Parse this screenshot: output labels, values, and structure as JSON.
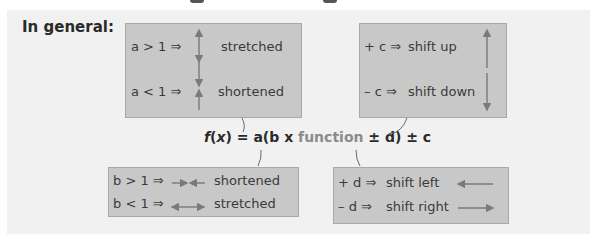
{
  "heading": "In general:",
  "formula": {
    "lhs_f": "f",
    "lhs_paren_open": "(",
    "lhs_x": "x",
    "lhs_paren_close": ")",
    "middle": " = a(b x ",
    "function_word": "function",
    "end": " ± d) ± c"
  },
  "boxes": {
    "a_box": {
      "rows": [
        {
          "condition": "a > 1 ⇒",
          "result": "stretched",
          "icon": "vertical-double-arrow-outward"
        },
        {
          "condition": "a < 1 ⇒",
          "result": "shortened",
          "icon": "vertical-arrows-inward"
        }
      ]
    },
    "c_box": {
      "rows": [
        {
          "condition": "+ c ⇒",
          "result": "shift up",
          "icon": "arrow-up"
        },
        {
          "condition": "– c ⇒",
          "result": "shift down",
          "icon": "arrow-down"
        }
      ]
    },
    "b_box": {
      "rows": [
        {
          "condition": "b > 1 ⇒",
          "result": "shortened",
          "icon": "horizontal-arrows-inward"
        },
        {
          "condition": "b < 1 ⇒",
          "result": "stretched",
          "icon": "horizontal-double-arrow-outward"
        }
      ]
    },
    "d_box": {
      "rows": [
        {
          "condition": "+ d ⇒",
          "result": "shift left",
          "icon": "arrow-left"
        },
        {
          "condition": "– d ⇒",
          "result": "shift right",
          "icon": "arrow-right"
        }
      ]
    }
  },
  "colors": {
    "panel_bg": "#f1f1f1",
    "box_bg": "#c8c8c8",
    "box_border": "#a9a9a9",
    "text": "#3a3a3a",
    "arrow": "#7a7a7a",
    "function_word": "#8b8b8b"
  }
}
